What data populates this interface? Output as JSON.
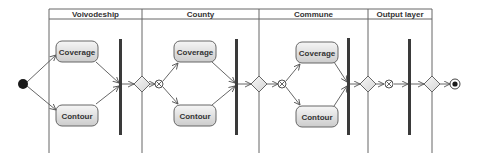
{
  "diagram": {
    "type": "uml-activity-diagram",
    "swimlanes": [
      {
        "id": "voivodeship",
        "label": "Voivodeship",
        "x1": 49,
        "x2": 142
      },
      {
        "id": "county",
        "label": "County",
        "x1": 142,
        "x2": 259
      },
      {
        "id": "commune",
        "label": "Commune",
        "x1": 259,
        "x2": 368
      },
      {
        "id": "output",
        "label": "Output layer",
        "x1": 368,
        "x2": 432
      }
    ],
    "actions": {
      "voivodeship": {
        "coverage": "Coverage",
        "contour": "Contour"
      },
      "county": {
        "coverage": "Coverage",
        "contour": "Contour"
      },
      "commune": {
        "coverage": "Coverage",
        "contour": "Contour"
      }
    },
    "nodes": {
      "initial": "initial-node",
      "final": "activity-final-node",
      "decisions": 4,
      "flow_finals": 3,
      "sync_bars": 4
    },
    "colors": {
      "line": "#555555",
      "bar": "#3a3a3a",
      "action_fill_top": "#f4f4f4",
      "action_fill_bottom": "#cfcfcf",
      "action_stroke": "#666666",
      "text": "#333333"
    }
  }
}
